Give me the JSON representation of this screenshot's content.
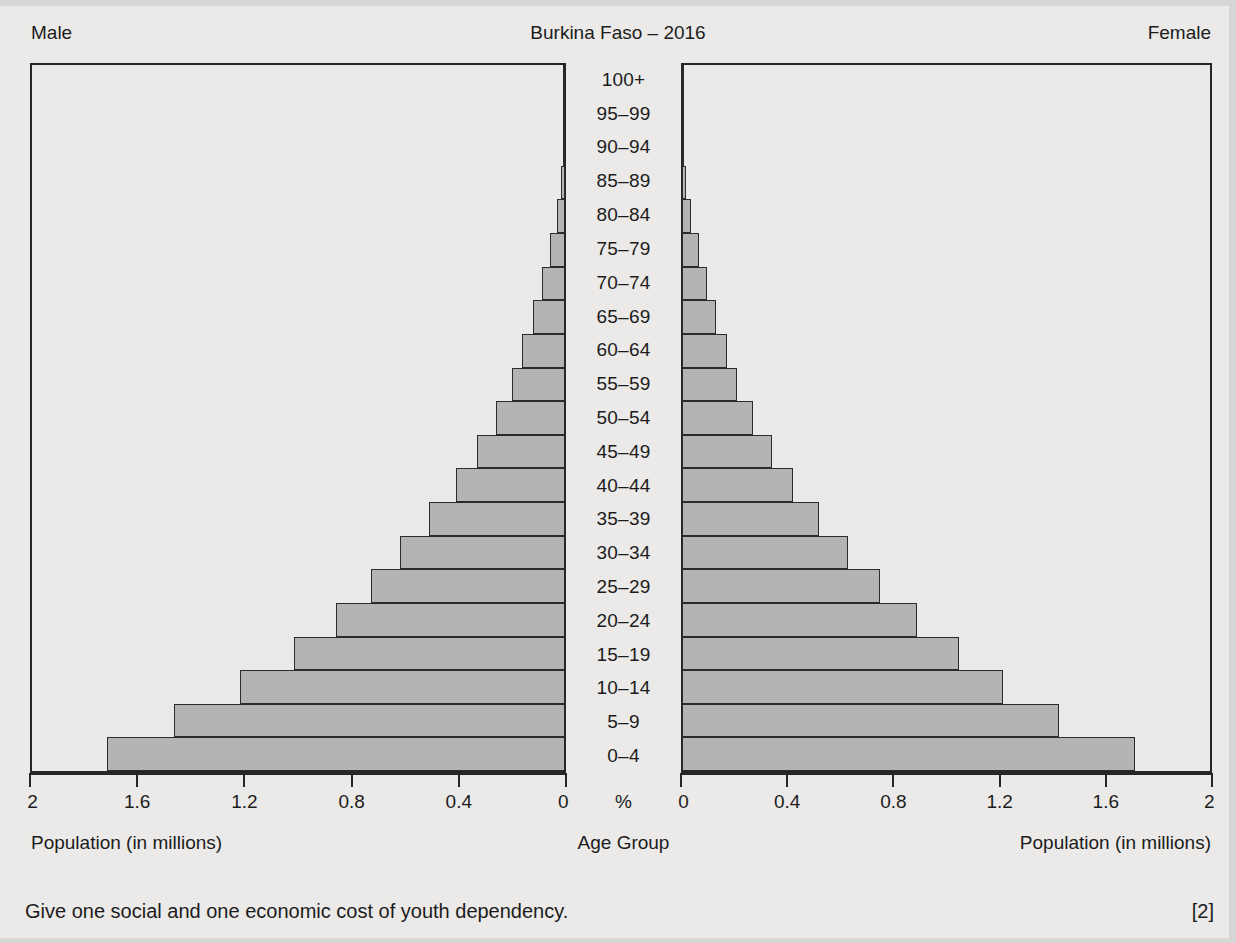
{
  "header": {
    "male_label": "Male",
    "title": "Burkina Faso – 2016",
    "female_label": "Female"
  },
  "axis": {
    "percent_symbol": "%",
    "left_ticklabels": [
      "2",
      "1.6",
      "1.2",
      "0.8",
      "0.4",
      "0"
    ],
    "right_ticklabels": [
      "0",
      "0.4",
      "0.8",
      "1.2",
      "1.6",
      "2"
    ],
    "left_caption": "Population (in millions)",
    "centre_caption": "Age Group",
    "right_caption": "Population (in millions)"
  },
  "question": {
    "text": "Give one social and one economic cost of youth dependency.",
    "marks": "[2]"
  },
  "colors": {
    "bar_fill": "#b4b4b4",
    "bar_border": "#2b2b2b",
    "background": "#ebeae8",
    "axis": "#262626"
  },
  "chart_data": {
    "type": "bar",
    "subtype": "population-pyramid",
    "title": "Burkina Faso – 2016",
    "xlabel": "Population (in millions)",
    "ylabel": "Age Group",
    "xlim": [
      0,
      2
    ],
    "grid": false,
    "legend": [
      "Male",
      "Female"
    ],
    "legend_position": "top-left and top-right",
    "categories": [
      "0–4",
      "5–9",
      "10–14",
      "15–19",
      "20–24",
      "25–29",
      "30–34",
      "35–39",
      "40–44",
      "45–49",
      "50–54",
      "55–59",
      "60–64",
      "65–69",
      "70–74",
      "75–79",
      "80–84",
      "85–89",
      "90–94",
      "95–99",
      "100+"
    ],
    "series": [
      {
        "name": "Male",
        "direction": "left",
        "values": [
          1.72,
          1.47,
          1.22,
          1.02,
          0.86,
          0.73,
          0.62,
          0.51,
          0.41,
          0.33,
          0.26,
          0.2,
          0.16,
          0.12,
          0.085,
          0.055,
          0.03,
          0.014,
          0.006,
          0.002,
          0.001
        ]
      },
      {
        "name": "Female",
        "direction": "right",
        "values": [
          1.72,
          1.43,
          1.22,
          1.05,
          0.89,
          0.75,
          0.63,
          0.52,
          0.42,
          0.34,
          0.27,
          0.21,
          0.17,
          0.13,
          0.095,
          0.063,
          0.036,
          0.017,
          0.007,
          0.002,
          0.001
        ]
      }
    ]
  }
}
